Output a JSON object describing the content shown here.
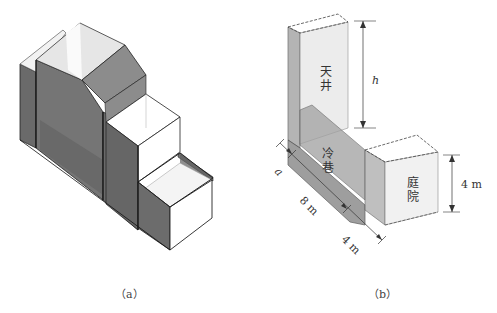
{
  "figure": {
    "panel_a": {
      "caption": "（a）"
    },
    "panel_b": {
      "caption": "（b）",
      "labels": {
        "skywell": [
          "天",
          "井"
        ],
        "cold_lane": [
          "冷",
          "巷"
        ],
        "courtyard": [
          "庭",
          "院"
        ]
      },
      "dimensions": {
        "skywell_height": "h",
        "lane_width": "a",
        "lane_length": "8 m",
        "courtyard_depth": "4 m",
        "courtyard_height": "4 m"
      }
    },
    "colors": {
      "dark_wall": "#6e6e6e",
      "mid_wall": "#8a8a8a",
      "light_wall": "#d9d9d9",
      "top_light": "#e8e8e8",
      "outline": "#222222",
      "transparent_wall": "#c8c8c8"
    }
  }
}
